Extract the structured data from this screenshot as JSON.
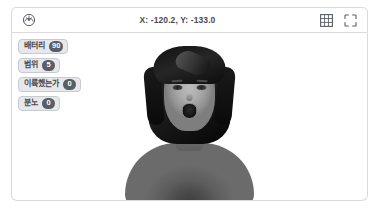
{
  "header": {
    "gauge_icon": "speedometer-icon",
    "coordinates": "X: -120.2, Y: -133.0",
    "grid_icon": "grid-icon",
    "fullscreen_icon": "fullscreen-icon"
  },
  "stage": {
    "sprite_name": "person-sprite"
  },
  "monitors": [
    {
      "label": "배터리",
      "value": "90"
    },
    {
      "label": "범위",
      "value": "5"
    },
    {
      "label": "이륙했는가",
      "value": "0"
    },
    {
      "label": "분노",
      "value": "0"
    }
  ],
  "colors": {
    "border": "#d9d9de",
    "text": "#4a4a50",
    "monitor_bg": "#e6e8eb",
    "monitor_border": "#c6cad1",
    "value_bg": "#5a5f66",
    "value_text": "#ffffff",
    "stage_bg": "#ffffff"
  }
}
